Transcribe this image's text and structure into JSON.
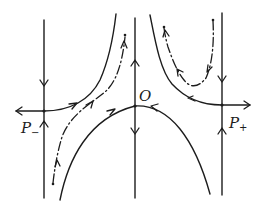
{
  "figure": {
    "type": "phase portrait",
    "ink_color": "#1c1c1c",
    "background": "#ffffff"
  },
  "labels": {
    "origin": "O",
    "p_minus_base": "P",
    "p_minus_sub": "−",
    "p_plus_base": "P",
    "p_plus_sub": "+"
  },
  "fixed_points": [
    {
      "name": "P-",
      "x": 44,
      "y": 111,
      "kind": "saddle"
    },
    {
      "name": "O",
      "x": 135,
      "y": 106,
      "kind": "saddle"
    },
    {
      "name": "P+",
      "x": 222,
      "y": 105,
      "kind": "saddle"
    }
  ],
  "invariant_lines": [
    {
      "name": "left-vertical",
      "x": 44,
      "flow": "toward P-"
    },
    {
      "name": "center-vertical",
      "x": 135,
      "flow": "away from O"
    },
    {
      "name": "right-vertical",
      "x": 222,
      "flow": "toward P+"
    }
  ],
  "separatrices": [
    {
      "name": "p-minus-unstable",
      "from": "P-",
      "direction": "left and up-right"
    },
    {
      "name": "p-plus-unstable",
      "from": "P+",
      "direction": "right and up-left"
    },
    {
      "name": "origin-stable-arch",
      "to": "O",
      "direction": "inward from both sides"
    }
  ],
  "trajectories": [
    {
      "name": "left-dashdot",
      "style": "dash-dot",
      "direction": "upward"
    },
    {
      "name": "right-dashdot-u",
      "style": "dash-dot",
      "direction": "down then up-left"
    }
  ]
}
